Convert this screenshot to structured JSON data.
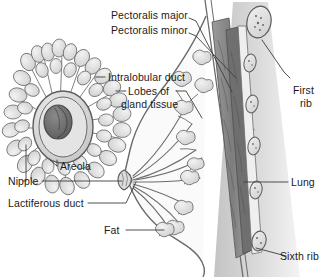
{
  "figure": {
    "background_color": "#ffffff",
    "ink_color": "#1b1b1b",
    "line_color": "#555555",
    "tissue_fill": "#e8e8e8",
    "muscle_fill": "#8d8d8d",
    "lung_fill": "#d8d8d8",
    "nipple_fill": "#6e6e6e"
  },
  "labels": {
    "pectoralis_major": "Pectoralis major",
    "pectoralis_minor": "Pectoralis minor",
    "intralobular_duct": "Intralobular duct",
    "lobes_line1": "Lobes of",
    "lobes_line2": "gland tissue",
    "areola": "Areola",
    "nipple": "Nipple",
    "lactiferous_duct": "Lactiferous duct",
    "fat": "Fat",
    "first_rib_line1": "First",
    "first_rib_line2": "rib",
    "lung": "Lung",
    "sixth_rib": "Sixth rib"
  },
  "structures": [
    {
      "name": "pectoralis-major",
      "view": "sagittal",
      "description": "outer chest wall muscle layer"
    },
    {
      "name": "pectoralis-minor",
      "view": "sagittal",
      "description": "inner chest wall muscle layer"
    },
    {
      "name": "intralobular-duct",
      "view": "frontal",
      "description": "small duct draining a lobule"
    },
    {
      "name": "lobes-of-gland-tissue",
      "view": "both",
      "description": "grape-like glandular lobules"
    },
    {
      "name": "areola",
      "view": "frontal",
      "description": "pigmented ring around the nipple"
    },
    {
      "name": "nipple",
      "view": "both",
      "description": "central projection where ducts open"
    },
    {
      "name": "lactiferous-duct",
      "view": "sagittal",
      "description": "duct carrying milk to nipple"
    },
    {
      "name": "fat",
      "view": "sagittal",
      "description": "adipose tissue filling the breast"
    },
    {
      "name": "first-rib",
      "view": "sagittal",
      "description": "uppermost rib cross-section"
    },
    {
      "name": "lung",
      "view": "sagittal",
      "description": "lung deep to the chest wall"
    },
    {
      "name": "sixth-rib",
      "view": "sagittal",
      "description": "lowermost rib cross-section shown"
    }
  ]
}
